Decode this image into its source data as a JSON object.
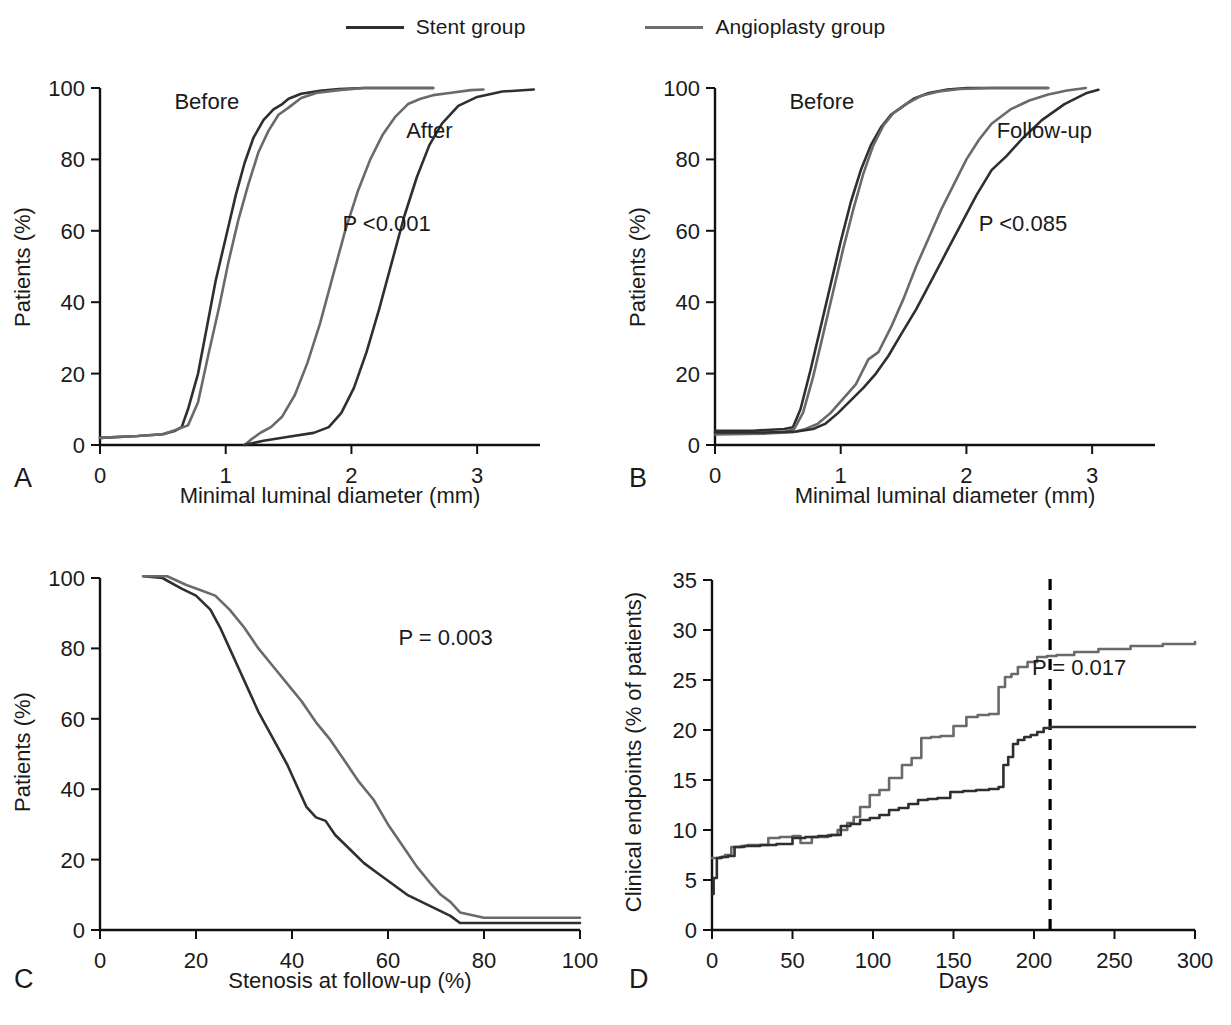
{
  "legend": {
    "entries": [
      {
        "label": "Stent group",
        "color": "#2f2f2f",
        "key": "stent"
      },
      {
        "label": "Angioplasty group",
        "color": "#6a6a6a",
        "key": "angioplasty"
      }
    ]
  },
  "panels": {
    "A": {
      "letter": "A"
    },
    "B": {
      "letter": "B"
    },
    "C": {
      "letter": "C"
    },
    "D": {
      "letter": "D"
    }
  },
  "chart_data": [
    {
      "id": "A",
      "type": "line",
      "title": "",
      "xlabel": "Minimal luminal diameter (mm)",
      "ylabel": "Patients (%)",
      "xlim": [
        0,
        3.5
      ],
      "ylim": [
        0,
        100
      ],
      "xticks": [
        0,
        1,
        2,
        3
      ],
      "xticklabels": [
        "0",
        "1",
        "2",
        "3"
      ],
      "yticks": [
        0,
        20,
        40,
        60,
        80,
        100
      ],
      "yticklabels": [
        "0",
        "20",
        "40",
        "60",
        "80",
        "100"
      ],
      "grid": false,
      "legend_position": "figure-top",
      "annotations": [
        {
          "text": "Before",
          "x": 0.85,
          "y": 94
        },
        {
          "text": "After",
          "x": 2.62,
          "y": 86
        },
        {
          "text": "P <0.001",
          "x": 2.28,
          "y": 60
        }
      ],
      "series": [
        {
          "name": "Stent group before",
          "color": "#2f2f2f",
          "x": [
            0,
            0.3,
            0.5,
            0.6,
            0.65,
            0.7,
            0.78,
            0.85,
            0.92,
            1.0,
            1.08,
            1.15,
            1.22,
            1.3,
            1.38,
            1.45,
            1.5,
            1.6,
            1.75,
            1.9,
            2.1,
            2.4,
            2.65
          ],
          "y": [
            2,
            2.5,
            3,
            4,
            5,
            10,
            20,
            33,
            46,
            58,
            70,
            79,
            86,
            91,
            94,
            95.5,
            97,
            98.4,
            99.2,
            99.7,
            100,
            100,
            100
          ]
        },
        {
          "name": "Angioplasty group before",
          "color": "#6a6a6a",
          "x": [
            0,
            0.3,
            0.5,
            0.6,
            0.7,
            0.78,
            0.86,
            0.95,
            1.02,
            1.1,
            1.18,
            1.26,
            1.34,
            1.42,
            1.5,
            1.6,
            1.72,
            1.9,
            2.1,
            2.4,
            2.65
          ],
          "y": [
            2,
            2.5,
            3,
            4.2,
            5.5,
            12,
            25,
            39,
            51,
            63,
            73,
            82,
            88,
            92.5,
            94.5,
            97.2,
            98.6,
            99.4,
            100,
            100,
            100
          ]
        },
        {
          "name": "Angioplasty group after",
          "color": "#6a6a6a",
          "x": [
            1.15,
            1.2,
            1.28,
            1.36,
            1.45,
            1.55,
            1.65,
            1.75,
            1.85,
            1.95,
            2.05,
            2.15,
            2.25,
            2.35,
            2.45,
            2.55,
            2.65,
            2.78,
            2.95,
            3.05
          ],
          "y": [
            0,
            1.5,
            3.5,
            5,
            8,
            14,
            23,
            34,
            47,
            60,
            71,
            80,
            87,
            92,
            95.5,
            97,
            98,
            98.6,
            99.4,
            99.6
          ]
        },
        {
          "name": "Stent group after",
          "color": "#2f2f2f",
          "x": [
            1.15,
            1.3,
            1.5,
            1.7,
            1.82,
            1.92,
            2.02,
            2.12,
            2.22,
            2.32,
            2.42,
            2.52,
            2.62,
            2.72,
            2.85,
            3.0,
            3.2,
            3.45
          ],
          "y": [
            0,
            1.2,
            2.3,
            3.4,
            5,
            9,
            16,
            26,
            38,
            51,
            64,
            75,
            84,
            90,
            95,
            97.5,
            99,
            99.6
          ]
        }
      ]
    },
    {
      "id": "B",
      "type": "line",
      "title": "",
      "xlabel": "Minimal luminal diameter (mm)",
      "ylabel": "Patients (%)",
      "xlim": [
        0,
        3.5
      ],
      "ylim": [
        0,
        100
      ],
      "xticks": [
        0,
        1,
        2,
        3
      ],
      "xticklabels": [
        "0",
        "1",
        "2",
        "3"
      ],
      "yticks": [
        0,
        20,
        40,
        60,
        80,
        100
      ],
      "yticklabels": [
        "0",
        "20",
        "40",
        "60",
        "80",
        "100"
      ],
      "grid": false,
      "legend_position": "figure-top",
      "annotations": [
        {
          "text": "Before",
          "x": 0.85,
          "y": 94
        },
        {
          "text": "Follow-up",
          "x": 2.62,
          "y": 86
        },
        {
          "text": "P <0.085",
          "x": 2.45,
          "y": 60
        }
      ],
      "series": [
        {
          "name": "Stent group before",
          "color": "#2f2f2f",
          "x": [
            0,
            0.3,
            0.55,
            0.62,
            0.68,
            0.76,
            0.84,
            0.92,
            1.0,
            1.08,
            1.16,
            1.24,
            1.32,
            1.4,
            1.48,
            1.58,
            1.7,
            1.85,
            2.0,
            2.3,
            2.65
          ],
          "y": [
            4,
            4,
            4.5,
            5,
            10,
            21,
            33,
            45,
            57,
            68,
            77,
            84,
            89,
            92.5,
            94.5,
            97,
            98.6,
            99.6,
            100,
            100,
            100
          ]
        },
        {
          "name": "Angioplasty group before",
          "color": "#6a6a6a",
          "x": [
            0,
            0.3,
            0.55,
            0.63,
            0.7,
            0.78,
            0.86,
            0.94,
            1.02,
            1.1,
            1.18,
            1.26,
            1.34,
            1.42,
            1.52,
            1.64,
            1.78,
            1.95,
            2.2,
            2.65
          ],
          "y": [
            3,
            3.2,
            3.6,
            4.5,
            9,
            19,
            31,
            43,
            55,
            66,
            76,
            84,
            89.5,
            93,
            95.5,
            97.8,
            99,
            99.7,
            100,
            100
          ]
        },
        {
          "name": "Angioplasty group follow-up",
          "color": "#6a6a6a",
          "x": [
            0,
            0.4,
            0.62,
            0.72,
            0.82,
            0.92,
            1.02,
            1.12,
            1.22,
            1.3,
            1.4,
            1.5,
            1.6,
            1.7,
            1.8,
            1.9,
            2.0,
            2.1,
            2.2,
            2.35,
            2.5,
            2.65,
            2.8,
            2.95
          ],
          "y": [
            3,
            3.2,
            3.6,
            4.5,
            6,
            9,
            13,
            17,
            24,
            26,
            33,
            41,
            50,
            58,
            66,
            73,
            80,
            85.5,
            90,
            94,
            96.5,
            98.2,
            99.3,
            100
          ]
        },
        {
          "name": "Stent group follow-up",
          "color": "#2f2f2f",
          "x": [
            0,
            0.4,
            0.65,
            0.78,
            0.88,
            0.98,
            1.08,
            1.18,
            1.28,
            1.38,
            1.48,
            1.6,
            1.72,
            1.84,
            1.96,
            2.08,
            2.2,
            2.32,
            2.45,
            2.6,
            2.78,
            2.95,
            3.05
          ],
          "y": [
            3.5,
            3.5,
            3.8,
            4.5,
            6,
            9,
            12.5,
            16,
            20,
            25,
            31,
            38,
            46,
            54,
            62,
            70,
            77,
            81,
            86,
            91,
            95.5,
            98.5,
            99.5
          ]
        }
      ]
    },
    {
      "id": "C",
      "type": "line",
      "title": "",
      "xlabel": "Stenosis at follow-up (%)",
      "ylabel": "Patients (%)",
      "xlim": [
        0,
        100
      ],
      "ylim": [
        0,
        100
      ],
      "xticks": [
        0,
        20,
        40,
        60,
        80,
        100
      ],
      "xticklabels": [
        "0",
        "20",
        "40",
        "60",
        "80",
        "100"
      ],
      "yticks": [
        0,
        20,
        40,
        60,
        80,
        100
      ],
      "yticklabels": [
        "0",
        "20",
        "40",
        "60",
        "80",
        "100"
      ],
      "grid": false,
      "legend_position": "figure-top",
      "annotations": [
        {
          "text": "P = 0.003",
          "x": 72,
          "y": 81
        }
      ],
      "series": [
        {
          "name": "Stent group",
          "color": "#2f2f2f",
          "x": [
            9,
            13,
            17,
            20,
            23,
            25,
            27,
            29,
            31,
            33,
            35,
            37,
            39,
            41,
            43,
            45,
            47,
            49,
            52,
            55,
            58,
            61,
            64,
            67,
            70,
            73,
            75,
            80,
            90,
            100
          ],
          "y": [
            100.5,
            100,
            97,
            95,
            91,
            86,
            80,
            74,
            68,
            62,
            57,
            52,
            47,
            41,
            35,
            32,
            31,
            27,
            23,
            19,
            16,
            13,
            10,
            8,
            6,
            4,
            2,
            2,
            2,
            2
          ]
        },
        {
          "name": "Angioplasty group",
          "color": "#6a6a6a",
          "x": [
            9,
            14,
            18,
            21,
            24,
            27,
            30,
            33,
            36,
            39,
            42,
            45,
            48,
            51,
            54,
            57,
            60,
            63,
            66,
            69,
            71,
            73,
            75,
            80,
            90,
            100
          ],
          "y": [
            100.5,
            100.5,
            98,
            96.5,
            95,
            91,
            86,
            80,
            75,
            70,
            65,
            59,
            54,
            48,
            42,
            37,
            30,
            24,
            18,
            13,
            10,
            8,
            5,
            3.5,
            3.5,
            3.5
          ]
        }
      ]
    },
    {
      "id": "D",
      "type": "line",
      "title": "",
      "xlabel": "Days",
      "ylabel": "Clinical endpoints (% of patients)",
      "xlim": [
        0,
        300
      ],
      "ylim": [
        0,
        35
      ],
      "xticks": [
        0,
        50,
        100,
        150,
        200,
        250,
        300
      ],
      "xticklabels": [
        "0",
        "50",
        "100",
        "150",
        "200",
        "250",
        "300"
      ],
      "yticks": [
        0,
        5,
        10,
        15,
        20,
        25,
        30,
        35
      ],
      "yticklabels": [
        "0",
        "5",
        "10",
        "15",
        "20",
        "25",
        "30",
        "35"
      ],
      "grid": false,
      "legend_position": "figure-top",
      "step": true,
      "annotations": [
        {
          "text": "P = 0.017",
          "x": 228,
          "y": 25.5
        }
      ],
      "reference_lines": [
        {
          "orientation": "vertical",
          "x": 210,
          "style": "dashed",
          "color": "#000000"
        }
      ],
      "series": [
        {
          "name": "Angioplasty group",
          "color": "#6a6a6a",
          "x": [
            0,
            2,
            5,
            8,
            12,
            18,
            22,
            35,
            42,
            50,
            55,
            62,
            72,
            78,
            84,
            88,
            92,
            98,
            104,
            110,
            118,
            124,
            130,
            136,
            142,
            150,
            158,
            165,
            172,
            178,
            182,
            186,
            190,
            196,
            202,
            208,
            214,
            225,
            240,
            260,
            280,
            300
          ],
          "y": [
            7.2,
            7.2,
            7.3,
            7.5,
            8.3,
            8.4,
            8.5,
            9.2,
            9.3,
            9.4,
            8.7,
            9.3,
            9.5,
            10.0,
            10.7,
            11.3,
            12.3,
            13.5,
            14.0,
            15.2,
            16.5,
            17.2,
            19.2,
            19.3,
            19.4,
            20.4,
            21.3,
            21.5,
            21.6,
            24.3,
            25.3,
            25.6,
            26.3,
            26.8,
            27.3,
            27.4,
            27.5,
            27.8,
            28.1,
            28.4,
            28.6,
            28.8
          ]
        },
        {
          "name": "Stent group",
          "color": "#2f2f2f",
          "x": [
            0,
            1,
            3,
            6,
            10,
            14,
            20,
            30,
            40,
            50,
            58,
            66,
            74,
            80,
            86,
            92,
            98,
            104,
            110,
            116,
            122,
            128,
            134,
            140,
            148,
            156,
            164,
            172,
            178,
            181,
            184,
            187,
            190,
            194,
            198,
            202,
            206,
            210,
            230,
            260,
            300
          ],
          "y": [
            3.6,
            5.2,
            7.2,
            7.3,
            7.4,
            8.3,
            8.4,
            8.5,
            8.6,
            9.2,
            9.3,
            9.4,
            9.5,
            10.4,
            10.6,
            11.0,
            11.2,
            11.5,
            12.0,
            12.2,
            12.6,
            13.0,
            13.1,
            13.2,
            13.8,
            13.9,
            14.0,
            14.1,
            14.3,
            16.5,
            17.3,
            18.6,
            19.0,
            19.3,
            19.5,
            19.8,
            20.2,
            20.3,
            20.3,
            20.3,
            20.3
          ]
        }
      ]
    }
  ]
}
